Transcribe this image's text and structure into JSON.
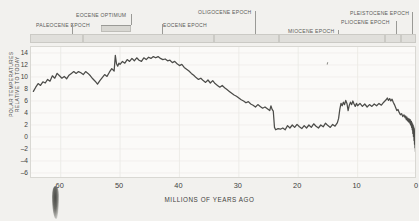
{
  "figure": {
    "y_axis_title": "POLAR TEMPERATURES RELATIVE TO TODAY",
    "x_axis_title": "MILLIONS OF YEARS AGO"
  },
  "epochs": [
    {
      "name": "PALEOCENE EPOCH",
      "start": 66,
      "end": 56,
      "label_x": 36,
      "label_y": 22,
      "leader_x": 72,
      "leader_y": 24,
      "leader_h": 10
    },
    {
      "name": "EOCENE OPTIMUM",
      "start": 53,
      "end": 48,
      "label_x": 76,
      "label_y": 12,
      "leader_x": 131,
      "leader_y": 14,
      "leader_h": 11,
      "highlight": true
    },
    {
      "name": "EOCENE EPOCH",
      "start": 56,
      "end": 34,
      "label_x": 163,
      "label_y": 22,
      "leader_x": 162,
      "leader_y": 24,
      "leader_h": 10
    },
    {
      "name": "OLIGOCENE EPOCH",
      "start": 34,
      "end": 23,
      "label_x": 198,
      "label_y": 9,
      "leader_x": 255,
      "leader_y": 11,
      "leader_h": 23
    },
    {
      "name": "MIOCENE EPOCH",
      "start": 23,
      "end": 5.3,
      "label_x": 288,
      "label_y": 28,
      "leader_x": 338,
      "leader_y": 30,
      "leader_h": 4
    },
    {
      "name": "PLIOCENE EPOCH",
      "start": 5.3,
      "end": 2.6,
      "label_x": 341,
      "label_y": 19,
      "leader_x": 396,
      "leader_y": 21,
      "leader_h": 13
    },
    {
      "name": "PLEISTOCENE EPOCH",
      "start": 2.6,
      "end": 0.01,
      "label_x": 350,
      "label_y": 10,
      "leader_x": 412,
      "leader_y": 12,
      "leader_h": 22
    }
  ],
  "chart_data": {
    "type": "line",
    "title": "",
    "xlabel": "MILLIONS OF YEARS AGO",
    "ylabel": "POLAR TEMPERATURES RELATIVE TO TODAY",
    "xlim": [
      65,
      0
    ],
    "ylim": [
      -7,
      15
    ],
    "x_ticks": [
      60,
      50,
      40,
      30,
      20,
      10,
      0
    ],
    "y_ticks": [
      14,
      12,
      10,
      8,
      6,
      4,
      2,
      0,
      -2,
      -4,
      -6
    ],
    "x_reversed": true,
    "grid": true,
    "legend": null,
    "units": {
      "x": "million years ago",
      "y": "degrees relative to today"
    },
    "series": [
      {
        "name": "Polar temperature anomaly",
        "color": "#4c4c49",
        "points": [
          [
            64.6,
            7.6
          ],
          [
            64.2,
            8.3
          ],
          [
            63.8,
            8.9
          ],
          [
            63.4,
            8.6
          ],
          [
            63.0,
            9.2
          ],
          [
            62.6,
            9.0
          ],
          [
            62.2,
            9.6
          ],
          [
            61.8,
            9.3
          ],
          [
            61.4,
            10.2
          ],
          [
            61.0,
            9.8
          ],
          [
            60.6,
            10.6
          ],
          [
            60.2,
            10.2
          ],
          [
            59.8,
            9.8
          ],
          [
            59.4,
            10.1
          ],
          [
            59.0,
            9.7
          ],
          [
            58.6,
            10.3
          ],
          [
            58.2,
            10.6
          ],
          [
            57.8,
            10.9
          ],
          [
            57.4,
            10.6
          ],
          [
            57.0,
            10.9
          ],
          [
            56.6,
            10.7
          ],
          [
            56.2,
            10.4
          ],
          [
            55.8,
            10.9
          ],
          [
            55.4,
            10.6
          ],
          [
            55.0,
            10.2
          ],
          [
            54.6,
            9.7
          ],
          [
            54.2,
            9.3
          ],
          [
            53.8,
            8.8
          ],
          [
            53.4,
            9.4
          ],
          [
            53.0,
            9.9
          ],
          [
            52.6,
            10.4
          ],
          [
            52.2,
            10.1
          ],
          [
            51.8,
            10.8
          ],
          [
            51.4,
            11.4
          ],
          [
            51.0,
            11.0
          ],
          [
            50.8,
            13.6
          ],
          [
            50.6,
            12.2
          ],
          [
            50.4,
            11.8
          ],
          [
            50.2,
            12.3
          ],
          [
            50.0,
            12.1
          ],
          [
            49.6,
            12.6
          ],
          [
            49.2,
            12.3
          ],
          [
            48.8,
            12.9
          ],
          [
            48.4,
            12.6
          ],
          [
            48.0,
            13.1
          ],
          [
            47.6,
            12.7
          ],
          [
            47.2,
            13.2
          ],
          [
            46.8,
            12.8
          ],
          [
            46.4,
            12.6
          ],
          [
            46.0,
            13.2
          ],
          [
            45.6,
            12.9
          ],
          [
            45.2,
            13.3
          ],
          [
            44.8,
            13.1
          ],
          [
            44.4,
            13.4
          ],
          [
            44.0,
            13.2
          ],
          [
            43.6,
            13.4
          ],
          [
            43.2,
            13.1
          ],
          [
            42.8,
            12.9
          ],
          [
            42.4,
            13.0
          ],
          [
            42.0,
            12.7
          ],
          [
            41.6,
            12.8
          ],
          [
            41.2,
            12.4
          ],
          [
            40.8,
            12.6
          ],
          [
            40.4,
            12.2
          ],
          [
            40.0,
            11.9
          ],
          [
            39.6,
            12.1
          ],
          [
            39.2,
            11.6
          ],
          [
            38.8,
            11.3
          ],
          [
            38.4,
            11.0
          ],
          [
            38.0,
            10.6
          ],
          [
            37.6,
            10.3
          ],
          [
            37.2,
            9.9
          ],
          [
            36.8,
            9.6
          ],
          [
            36.4,
            9.8
          ],
          [
            36.0,
            9.4
          ],
          [
            35.6,
            9.1
          ],
          [
            35.2,
            9.5
          ],
          [
            34.8,
            9.0
          ],
          [
            34.4,
            9.4
          ],
          [
            34.0,
            8.9
          ],
          [
            33.6,
            8.6
          ],
          [
            33.2,
            8.3
          ],
          [
            32.8,
            8.6
          ],
          [
            32.4,
            8.2
          ],
          [
            32.0,
            7.9
          ],
          [
            31.6,
            7.6
          ],
          [
            31.2,
            7.3
          ],
          [
            30.8,
            7.0
          ],
          [
            30.4,
            6.8
          ],
          [
            30.0,
            6.5
          ],
          [
            29.6,
            6.2
          ],
          [
            29.2,
            6.0
          ],
          [
            28.8,
            5.7
          ],
          [
            28.4,
            5.9
          ],
          [
            28.0,
            5.5
          ],
          [
            27.6,
            5.3
          ],
          [
            27.2,
            5.0
          ],
          [
            26.8,
            5.4
          ],
          [
            26.4,
            5.1
          ],
          [
            26.0,
            4.8
          ],
          [
            25.6,
            5.0
          ],
          [
            25.2,
            4.7
          ],
          [
            24.8,
            4.4
          ],
          [
            24.6,
            5.2
          ],
          [
            24.4,
            4.6
          ],
          [
            24.2,
            4.3
          ],
          [
            24.0,
            1.6
          ],
          [
            23.8,
            1.2
          ],
          [
            23.4,
            1.4
          ],
          [
            23.0,
            1.3
          ],
          [
            22.6,
            1.5
          ],
          [
            22.2,
            1.2
          ],
          [
            21.8,
            1.9
          ],
          [
            21.4,
            1.5
          ],
          [
            21.0,
            2.0
          ],
          [
            20.6,
            1.6
          ],
          [
            20.2,
            2.1
          ],
          [
            19.8,
            1.7
          ],
          [
            19.4,
            1.4
          ],
          [
            19.0,
            1.9
          ],
          [
            18.6,
            1.5
          ],
          [
            18.2,
            2.0
          ],
          [
            17.8,
            1.6
          ],
          [
            17.4,
            2.2
          ],
          [
            17.0,
            1.8
          ],
          [
            16.6,
            1.5
          ],
          [
            16.2,
            2.0
          ],
          [
            15.8,
            1.7
          ],
          [
            15.4,
            2.3
          ],
          [
            15.0,
            1.9
          ],
          [
            14.6,
            1.6
          ],
          [
            14.2,
            2.1
          ],
          [
            13.8,
            1.8
          ],
          [
            13.4,
            2.4
          ],
          [
            13.2,
            3.1
          ],
          [
            13.0,
            4.6
          ],
          [
            12.8,
            5.6
          ],
          [
            12.6,
            5.2
          ],
          [
            12.4,
            5.8
          ],
          [
            12.2,
            5.4
          ],
          [
            12.0,
            6.1
          ],
          [
            11.8,
            5.6
          ],
          [
            11.6,
            4.4
          ],
          [
            11.4,
            5.3
          ],
          [
            11.2,
            5.8
          ],
          [
            11.0,
            5.4
          ],
          [
            10.8,
            6.0
          ],
          [
            10.6,
            5.5
          ],
          [
            10.4,
            5.1
          ],
          [
            10.2,
            5.6
          ],
          [
            10.0,
            5.2
          ],
          [
            9.6,
            5.6
          ],
          [
            9.2,
            5.1
          ],
          [
            8.8,
            5.5
          ],
          [
            8.4,
            5.0
          ],
          [
            8.0,
            5.4
          ],
          [
            7.6,
            5.1
          ],
          [
            7.2,
            5.5
          ],
          [
            6.8,
            5.2
          ],
          [
            6.4,
            5.6
          ],
          [
            6.0,
            5.3
          ],
          [
            5.6,
            5.8
          ],
          [
            5.2,
            6.2
          ],
          [
            5.0,
            6.5
          ],
          [
            4.8,
            6.1
          ],
          [
            4.6,
            6.4
          ],
          [
            4.4,
            6.0
          ],
          [
            4.2,
            6.3
          ],
          [
            4.0,
            5.8
          ],
          [
            3.8,
            5.4
          ],
          [
            3.6,
            4.9
          ],
          [
            3.4,
            4.4
          ],
          [
            3.2,
            4.6
          ],
          [
            3.0,
            4.1
          ],
          [
            2.8,
            3.7
          ],
          [
            2.6,
            3.9
          ],
          [
            2.4,
            3.4
          ],
          [
            2.2,
            3.7
          ],
          [
            2.0,
            3.2
          ],
          [
            1.9,
            3.5
          ],
          [
            1.8,
            2.9
          ],
          [
            1.7,
            3.3
          ],
          [
            1.6,
            2.7
          ],
          [
            1.5,
            3.1
          ],
          [
            1.4,
            2.5
          ],
          [
            1.3,
            3.0
          ],
          [
            1.2,
            2.3
          ],
          [
            1.15,
            2.9
          ],
          [
            1.1,
            2.1
          ],
          [
            1.05,
            2.7
          ],
          [
            1.0,
            1.9
          ],
          [
            0.95,
            2.6
          ],
          [
            0.9,
            1.6
          ],
          [
            0.85,
            2.4
          ],
          [
            0.8,
            1.2
          ],
          [
            0.75,
            2.2
          ],
          [
            0.7,
            0.6
          ],
          [
            0.65,
            2.0
          ],
          [
            0.6,
            0.1
          ],
          [
            0.55,
            1.7
          ],
          [
            0.5,
            -0.6
          ],
          [
            0.46,
            1.4
          ],
          [
            0.42,
            -1.2
          ],
          [
            0.38,
            1.0
          ],
          [
            0.34,
            -1.8
          ],
          [
            0.3,
            0.6
          ],
          [
            0.26,
            -2.4
          ],
          [
            0.22,
            0.3
          ],
          [
            0.18,
            -3.1
          ],
          [
            0.15,
            -0.2
          ],
          [
            0.12,
            -3.8
          ],
          [
            0.09,
            -0.8
          ],
          [
            0.06,
            -4.5
          ],
          [
            0.04,
            -1.6
          ],
          [
            0.02,
            -5.2
          ],
          [
            0.0,
            -2.2
          ]
        ]
      }
    ]
  }
}
